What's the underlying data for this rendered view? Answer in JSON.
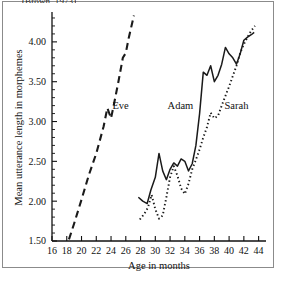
{
  "figure": {
    "source_caption": "(Brown, 1973)",
    "frame_color": "#8b8b8b"
  },
  "chart_data": {
    "type": "line",
    "title": "",
    "subtitle": "",
    "xlabel": "Age in months",
    "ylabel": "Mean utterance length in morphemes",
    "xlim": [
      16,
      45
    ],
    "ylim": [
      1.5,
      4.35
    ],
    "xticks": [
      16,
      18,
      20,
      22,
      24,
      26,
      28,
      30,
      32,
      34,
      36,
      38,
      40,
      42,
      44
    ],
    "xtick_labels": [
      "16",
      "18",
      "20",
      "22",
      "24",
      "26",
      "28",
      "30",
      "32",
      "34",
      "36",
      "38",
      "40",
      "42",
      "44"
    ],
    "yticks": [
      1.5,
      2.0,
      2.5,
      3.0,
      3.5,
      4.0
    ],
    "ytick_labels": [
      "1.50",
      "2.00",
      "2.50",
      "3.00",
      "3.50",
      "4.00"
    ],
    "y_minor_step": 0.1,
    "grid": false,
    "legend_position": "inline-annotations",
    "series": [
      {
        "name": "Eve",
        "style": "dashed",
        "color": "#1a1a1a",
        "label_x": 25.3,
        "label_y": 3.16,
        "x": [
          18.3,
          19.0,
          20.0,
          21.0,
          22.0,
          23.0,
          23.5,
          24.0,
          24.4,
          25.0,
          25.6,
          26.0,
          26.4,
          27.1
        ],
        "y": [
          1.52,
          1.72,
          2.02,
          2.33,
          2.6,
          2.94,
          3.17,
          3.04,
          3.22,
          3.5,
          3.8,
          3.86,
          4.05,
          4.33
        ]
      },
      {
        "name": "Adam",
        "style": "solid",
        "color": "#1a1a1a",
        "label_x": 33.4,
        "label_y": 3.16,
        "x": [
          27.7,
          28.3,
          28.9,
          29.4,
          30.0,
          30.5,
          31.0,
          31.5,
          32.0,
          32.5,
          33.0,
          33.5,
          34.0,
          34.5,
          35.0,
          35.5,
          36.0,
          36.5,
          37.0,
          37.5,
          38.0,
          38.5,
          39.0,
          39.5,
          40.0,
          40.5,
          41.0,
          41.5,
          42.0,
          42.5,
          43.0,
          43.4
        ],
        "y": [
          2.05,
          2.0,
          1.97,
          2.14,
          2.3,
          2.6,
          2.38,
          2.27,
          2.4,
          2.48,
          2.44,
          2.53,
          2.5,
          2.38,
          2.47,
          2.7,
          3.1,
          3.62,
          3.58,
          3.7,
          3.5,
          3.58,
          3.72,
          3.93,
          3.85,
          3.8,
          3.72,
          3.85,
          4.02,
          4.06,
          4.09,
          4.12
        ]
      },
      {
        "name": "Sarah",
        "style": "dotted",
        "color": "#1a1a1a",
        "label_x": 41.0,
        "label_y": 3.16,
        "x": [
          27.9,
          28.5,
          29.0,
          29.5,
          30.0,
          30.5,
          31.0,
          31.5,
          32.0,
          32.5,
          33.0,
          33.5,
          34.0,
          34.5,
          35.0,
          35.5,
          36.0,
          36.5,
          37.0,
          37.5,
          38.0,
          38.5,
          39.0,
          39.5,
          40.0,
          40.5,
          41.0,
          41.5,
          42.0,
          42.5,
          43.0,
          43.5
        ],
        "y": [
          1.77,
          1.84,
          1.92,
          2.08,
          1.9,
          1.78,
          1.82,
          2.05,
          2.3,
          2.44,
          2.32,
          2.16,
          2.09,
          2.22,
          2.4,
          2.52,
          2.65,
          2.8,
          2.93,
          3.11,
          3.04,
          3.07,
          3.2,
          3.32,
          3.44,
          3.57,
          3.7,
          3.86,
          3.97,
          4.06,
          4.14,
          4.2
        ]
      }
    ]
  }
}
